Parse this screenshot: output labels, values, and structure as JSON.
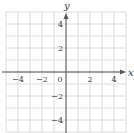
{
  "chart_data": {
    "type": "scatter",
    "title": "",
    "xlabel": "x",
    "ylabel": "y",
    "xlim": [
      -5,
      5
    ],
    "ylim": [
      -5,
      5
    ],
    "grid": true,
    "grid_step": 1,
    "x_ticks": [
      -4,
      -2,
      0,
      2,
      4
    ],
    "y_ticks": [
      4,
      2,
      -2,
      -4
    ],
    "x_tick_labels": [
      "−4",
      "−2",
      "0",
      "2",
      "4"
    ],
    "y_tick_labels": [
      "4",
      "2",
      "−2",
      "−4"
    ],
    "series": [],
    "legend": null
  },
  "colors": {
    "grid": "#dcdcdc",
    "axis": "#555555",
    "text": "#3a3a3a"
  }
}
